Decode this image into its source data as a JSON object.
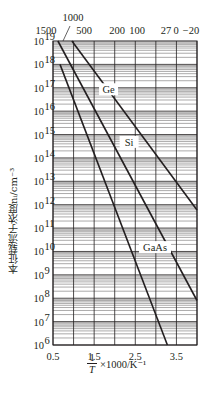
{
  "chart_data": {
    "type": "line",
    "title": "",
    "xlabel": "1/T ×1000/K⁻¹",
    "xlabel_parts": {
      "num": "1",
      "den": "T",
      "rest": "×1000/K⁻¹"
    },
    "ylabel": "本征载流子浓度n_i/cm⁻³",
    "ylabel_display": "本征载流子浓度nᵢ/cm⁻³",
    "yscale": "log",
    "xlim": [
      0.5,
      4.0
    ],
    "ylim": [
      1000000.0,
      1e+19
    ],
    "grid": true,
    "x_ticks": [
      {
        "value": 0.5,
        "label": "0.5"
      },
      {
        "value": 1.5,
        "label": "1.5"
      },
      {
        "value": 2.5,
        "label": "2.5"
      },
      {
        "value": 3.5,
        "label": "3.5"
      }
    ],
    "x_gridlines": [
      0.5,
      1.0,
      1.5,
      2.0,
      2.5,
      3.0,
      3.5,
      4.0
    ],
    "y_ticks": [
      {
        "exp": 19,
        "label": "10",
        "sup": "19"
      },
      {
        "exp": 18,
        "label": "10",
        "sup": "18"
      },
      {
        "exp": 17,
        "label": "10",
        "sup": "17"
      },
      {
        "exp": 16,
        "label": "10",
        "sup": "16"
      },
      {
        "exp": 15,
        "label": "10",
        "sup": "15"
      },
      {
        "exp": 14,
        "label": "10",
        "sup": "14"
      },
      {
        "exp": 13,
        "label": "10",
        "sup": "13"
      },
      {
        "exp": 12,
        "label": "10",
        "sup": "12"
      },
      {
        "exp": 11,
        "label": "10",
        "sup": "11"
      },
      {
        "exp": 10,
        "label": "10",
        "sup": "10"
      },
      {
        "exp": 9,
        "label": "10",
        "sup": "9"
      },
      {
        "exp": 8,
        "label": "10",
        "sup": "8"
      },
      {
        "exp": 7,
        "label": "10",
        "sup": "7"
      },
      {
        "exp": 6,
        "label": "10",
        "sup": "6"
      }
    ],
    "top_axis": {
      "label": "Temperature (°C)",
      "ticks": [
        {
          "label": "1500",
          "x": 46,
          "row": 2
        },
        {
          "label": "1000",
          "x": 73,
          "row": 1
        },
        {
          "label": "500",
          "x": 84,
          "row": 2
        },
        {
          "label": "200",
          "x": 117,
          "row": 2
        },
        {
          "label": "100",
          "x": 137,
          "row": 2
        },
        {
          "label": "27",
          "x": 166,
          "row": 2
        },
        {
          "label": "0",
          "x": 176,
          "row": 2
        },
        {
          "label": "−20",
          "x": 191,
          "row": 2
        }
      ]
    },
    "series": [
      {
        "name": "Ge",
        "label_pos": {
          "x": 1.85,
          "exp": 16.85
        },
        "points": [
          {
            "x": 0.96,
            "y": 1e+19
          },
          {
            "x": 4.0,
            "y": 600000000000.0
          }
        ]
      },
      {
        "name": "Si",
        "label_pos": {
          "x": 2.35,
          "exp": 14.6
        },
        "points": [
          {
            "x": 0.62,
            "y": 1e+19
          },
          {
            "x": 4.0,
            "y": 80000000.0
          }
        ]
      },
      {
        "name": "GaAs",
        "label_pos": {
          "x": 2.98,
          "exp": 10.1
        },
        "points": [
          {
            "x": 0.67,
            "y": 1e+18
          },
          {
            "x": 3.28,
            "y": 1000000.0
          }
        ]
      }
    ]
  },
  "colors": {
    "ink": "#231f20",
    "grid": "#231f20",
    "background": "#ffffff"
  }
}
